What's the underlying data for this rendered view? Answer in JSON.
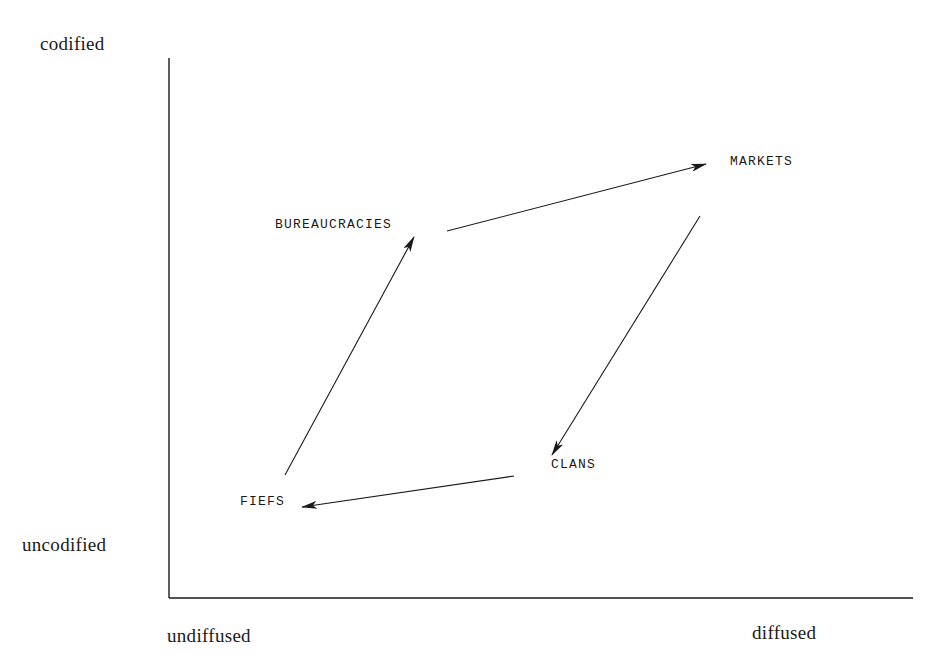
{
  "axes": {
    "y_top_label": "codified",
    "y_bottom_label": "uncodified",
    "x_left_label": "undiffused",
    "x_right_label": "diffused"
  },
  "nodes": {
    "bureaucracies": "BUREAUCRACIES",
    "markets": "MARKETS",
    "clans": "CLANS",
    "fiefs": "FIEFS"
  },
  "edges": [
    {
      "from": "FIEFS",
      "to": "BUREAUCRACIES"
    },
    {
      "from": "BUREAUCRACIES",
      "to": "MARKETS"
    },
    {
      "from": "MARKETS",
      "to": "CLANS"
    },
    {
      "from": "CLANS",
      "to": "FIEFS"
    }
  ],
  "colors": {
    "ink": "#1a1a1a",
    "background": "#ffffff"
  }
}
